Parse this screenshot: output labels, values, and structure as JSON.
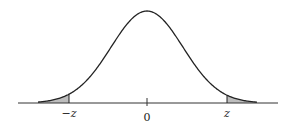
{
  "diagram": {
    "type": "normal-distribution-two-tailed",
    "labels": {
      "left_critical": "−z",
      "center": "0",
      "right_critical": "z"
    },
    "colors": {
      "curve": "#222222",
      "shade": "#bdbdbd",
      "axis": "#333333"
    }
  }
}
